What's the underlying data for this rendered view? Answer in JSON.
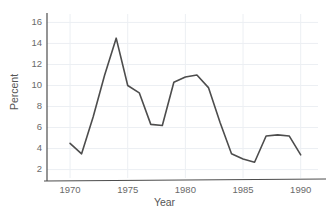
{
  "chart_data": {
    "type": "line",
    "title": "",
    "xlabel": "Year",
    "ylabel": "Percent",
    "x": [
      1970,
      1971,
      1972,
      1973,
      1974,
      1975,
      1976,
      1977,
      1978,
      1979,
      1980,
      1981,
      1982,
      1983,
      1984,
      1985,
      1986,
      1987,
      1988,
      1989,
      1990
    ],
    "values": [
      4.5,
      3.5,
      7.0,
      11.0,
      14.5,
      10.0,
      9.3,
      6.3,
      6.2,
      10.3,
      10.8,
      11.0,
      9.8,
      6.5,
      3.5,
      3.0,
      2.7,
      5.2,
      5.3,
      5.2,
      3.4
    ],
    "series": [
      {
        "name": "Percent",
        "values": [
          4.5,
          3.5,
          7.0,
          11.0,
          14.5,
          10.0,
          9.3,
          6.3,
          6.2,
          10.3,
          10.8,
          11.0,
          9.8,
          6.5,
          3.5,
          3.0,
          2.7,
          5.2,
          5.3,
          5.2,
          3.4
        ]
      }
    ],
    "xlim": [
      1968,
      1991.5
    ],
    "ylim": [
      1.2,
      16.8
    ],
    "xticks": [
      1970,
      1975,
      1980,
      1985,
      1990
    ],
    "xtick_labels": [
      "1970",
      "1975",
      "1980",
      "1985",
      "1990"
    ],
    "yticks": [
      2,
      4,
      6,
      8,
      10,
      12,
      14,
      16
    ],
    "ytick_labels": [
      "2",
      "4",
      "6",
      "8",
      "10",
      "12",
      "14",
      "16"
    ],
    "grid": true,
    "grid_color": "#eceff3",
    "legend": false,
    "legend_position": "none",
    "line_color": "#4d4d4d",
    "line_width": 1.6,
    "axis_color": "#4d4d4d"
  }
}
